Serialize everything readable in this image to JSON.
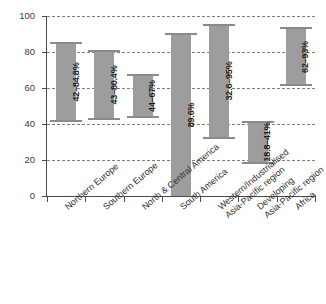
{
  "chart_data": {
    "type": "bar",
    "title": "",
    "xlabel": "",
    "ylabel": "",
    "ylim": [
      0,
      100
    ],
    "yticks": [
      0,
      20,
      40,
      60,
      80,
      100
    ],
    "grid": true,
    "legend": "none",
    "orientation": "vertical",
    "bar_style": "floating range bars with end caps",
    "categories": [
      "Northern Europe",
      "Southern Europe",
      "North & Central America",
      "South America",
      "Western/Industrialised Asia-Pacific region",
      "Developing Asia-Pacific region",
      "Africa"
    ],
    "category_lines": [
      [
        "Northern Europe",
        ""
      ],
      [
        "Southern Europe",
        ""
      ],
      [
        "North & Central America",
        ""
      ],
      [
        "South America",
        ""
      ],
      [
        "Western/Industrialised",
        "Asia-Pacific region"
      ],
      [
        "Developing",
        "Asia-Pacific region"
      ],
      [
        "Africa",
        ""
      ]
    ],
    "bars": [
      {
        "category": "Northern Europe",
        "low": 42.0,
        "high": 84.8,
        "label": "42–84.8%"
      },
      {
        "category": "Southern Europe",
        "low": 43.0,
        "high": 80.4,
        "label": "43–80.4%"
      },
      {
        "category": "North & Central America",
        "low": 44.0,
        "high": 67.0,
        "label": "44–67%"
      },
      {
        "category": "South America",
        "low": 0.0,
        "high": 89.6,
        "label": "89.6%"
      },
      {
        "category": "Western/Industrialised Asia-Pacific region",
        "low": 32.6,
        "high": 95.0,
        "label": "32.6–95%"
      },
      {
        "category": "Developing Asia-Pacific region",
        "low": 18.8,
        "high": 41.0,
        "label": "18.8–41%"
      },
      {
        "category": "Africa",
        "low": 62.0,
        "high": 93.0,
        "label": "62–93%"
      }
    ],
    "colors": {
      "bar_fill": "#9d9d9d",
      "cap": "#8a8a8a",
      "gridline": "#7e7e7e",
      "axis": "#4a4a4a",
      "tick_text": "#3b3b3b",
      "bar_label_text": "#1c1c1c",
      "category_text": "#2e2e2e",
      "background": "#ffffff"
    }
  }
}
